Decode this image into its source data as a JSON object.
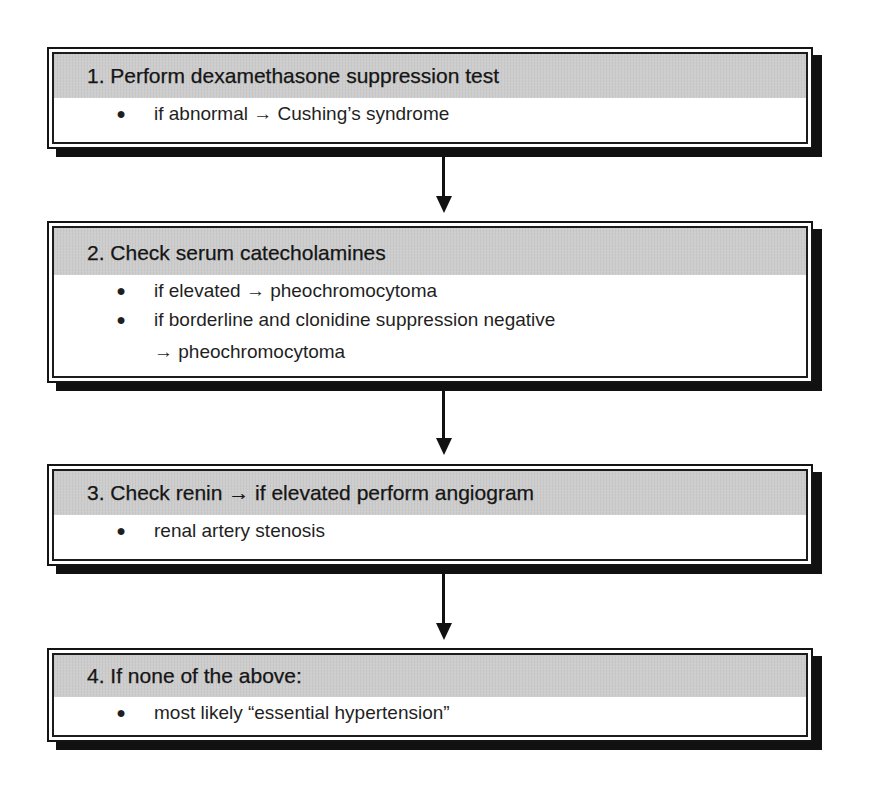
{
  "flowchart": {
    "steps": [
      {
        "number": "1.",
        "title": "1. Perform dexamethasone suppression test",
        "items": [
          "if abnormal → Cushing’s syndrome"
        ]
      },
      {
        "number": "2.",
        "title": "2. Check serum catecholamines",
        "items": [
          "if elevated → pheochromocytoma",
          "if borderline and clonidine suppression negative → pheochromocytoma"
        ]
      },
      {
        "number": "3.",
        "title": "3. Check renin → if elevated perform angiogram",
        "items": [
          "renal artery stenosis"
        ]
      },
      {
        "number": "4.",
        "title": "4. If none of the above:",
        "items": [
          "most likely “essential hypertension”"
        ]
      }
    ],
    "bullet_glyph": "●",
    "connectors": [
      {
        "from": 1,
        "to": 2,
        "icon": "arrow-down-icon"
      },
      {
        "from": 2,
        "to": 3,
        "icon": "arrow-down-icon"
      },
      {
        "from": 3,
        "to": 4,
        "icon": "arrow-down-icon"
      }
    ],
    "colors": {
      "header_band": "#cdcdcd",
      "border": "#141414",
      "shadow": "#111111",
      "background": "#ffffff"
    }
  }
}
